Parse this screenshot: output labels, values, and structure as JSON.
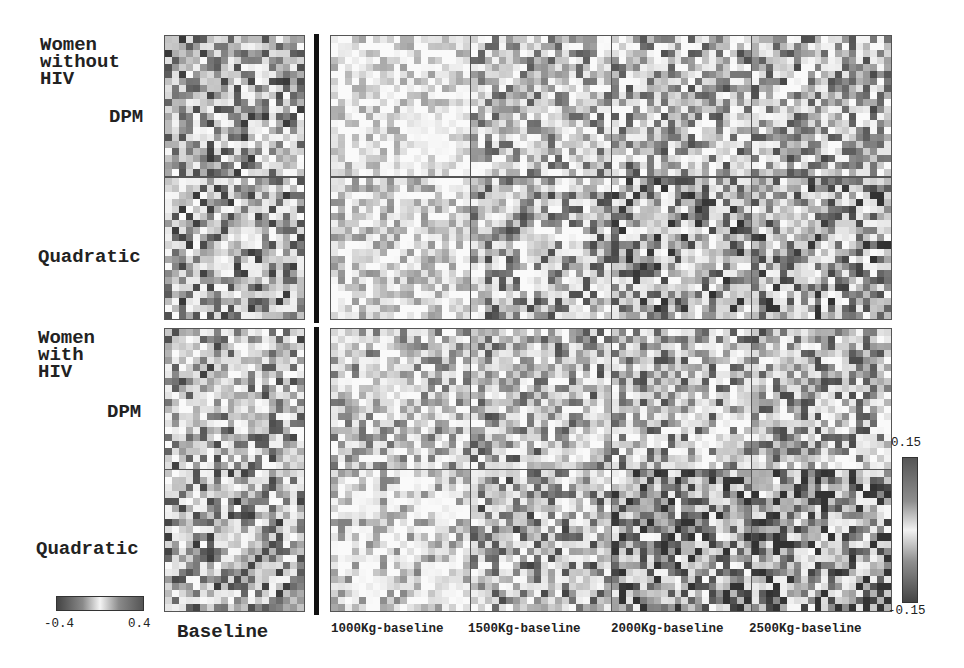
{
  "chart_data": {
    "type": "heatmap",
    "title": "",
    "groups": [
      {
        "label": "Women without HIV",
        "rows": [
          "DPM",
          "Quadratic"
        ]
      },
      {
        "label": "Women with HIV",
        "rows": [
          "DPM",
          "Quadratic"
        ]
      }
    ],
    "columns": [
      "Baseline",
      "1000Kg-baseline",
      "1500Kg-baseline",
      "2000Kg-baseline",
      "2500Kg-baseline"
    ],
    "grid_size": [
      20,
      20
    ],
    "baseline_colorbar": {
      "min": -0.4,
      "max": 0.4,
      "labels": [
        "-0.4",
        "0.4"
      ],
      "orientation": "horizontal"
    },
    "difference_colorbar": {
      "min": -0.15,
      "max": 0.15,
      "labels": [
        "0.15",
        "-0.15"
      ],
      "orientation": "vertical"
    },
    "colormap": "grayscale diverging (dark = extreme, light = near zero)",
    "intensity_by_column": {
      "note": "approximate mean darkness (0=white, 1=black) of each panel",
      "Women without HIV": {
        "DPM": [
          0.45,
          0.12,
          0.35,
          0.38,
          0.4
        ],
        "Quadratic": [
          0.45,
          0.18,
          0.4,
          0.48,
          0.52
        ]
      },
      "Women with HIV": {
        "DPM": [
          0.42,
          0.3,
          0.38,
          0.38,
          0.4
        ],
        "Quadratic": [
          0.45,
          0.22,
          0.42,
          0.55,
          0.6
        ]
      }
    }
  },
  "labels": {
    "group1": "Women\nwithout\nHIV",
    "group2": "Women\nwith\nHIV",
    "dpm": "DPM",
    "quadratic": "Quadratic",
    "baseline": "Baseline",
    "col1": "1000Kg-baseline",
    "col2": "1500Kg-baseline",
    "col3": "2000Kg-baseline",
    "col4": "2500Kg-baseline",
    "cbar_left_min": "-0.4",
    "cbar_left_max": "0.4",
    "cbar_right_max": "0.15",
    "cbar_right_min": "-0.15"
  }
}
